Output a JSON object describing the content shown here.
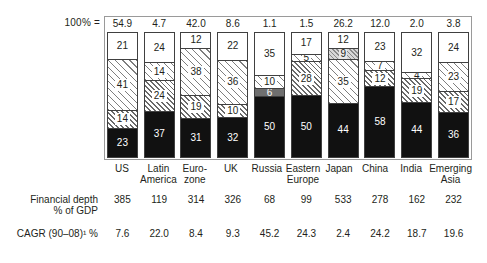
{
  "chart_data": {
    "type": "bar",
    "stacked": true,
    "title": "",
    "subtitle": "",
    "xlabel": "",
    "ylabel": "",
    "ylim": [
      0,
      100
    ],
    "grid": false,
    "legend_position": "none",
    "axis_note_label": "100% =",
    "categories": [
      "US",
      "Latin America",
      "Euro-zone",
      "UK",
      "Russia",
      "Eastern Europe",
      "Japan",
      "China",
      "India",
      "Emerging Asia"
    ],
    "category_lines": [
      [
        "US",
        ""
      ],
      [
        "Latin",
        "America"
      ],
      [
        "Euro-",
        "zone"
      ],
      [
        "UK",
        ""
      ],
      [
        "Russia",
        ""
      ],
      [
        "Eastern",
        "Europe"
      ],
      [
        "Japan",
        ""
      ],
      [
        "China",
        ""
      ],
      [
        "India",
        ""
      ],
      [
        "Emerging",
        "Asia"
      ]
    ],
    "totals": [
      "54.9",
      "4.7",
      "42.0",
      "8.6",
      "1.1",
      "1.5",
      "26.2",
      "12.0",
      "2.0",
      "3.8"
    ],
    "segments_top_to_bottom": [
      [
        {
          "value": 21,
          "fill": "white"
        },
        {
          "value": 41,
          "fill": "hatch"
        },
        {
          "value": 14,
          "fill": "hatch-dense"
        },
        {
          "value": 23,
          "fill": "black"
        }
      ],
      [
        {
          "value": 24,
          "fill": "white"
        },
        {
          "value": 14,
          "fill": "hatch"
        },
        {
          "value": 24,
          "fill": "hatch-dense"
        },
        {
          "value": 37,
          "fill": "black"
        }
      ],
      [
        {
          "value": 12,
          "fill": "white"
        },
        {
          "value": 38,
          "fill": "hatch"
        },
        {
          "value": 19,
          "fill": "hatch-dense"
        },
        {
          "value": 31,
          "fill": "black"
        }
      ],
      [
        {
          "value": 22,
          "fill": "white"
        },
        {
          "value": 36,
          "fill": "hatch"
        },
        {
          "value": 10,
          "fill": "hatch-dense"
        },
        {
          "value": 32,
          "fill": "black"
        }
      ],
      [
        {
          "value": 35,
          "fill": "white"
        },
        {
          "value": 10,
          "fill": "hatch"
        },
        {
          "value": 6,
          "fill": "gray"
        },
        {
          "value": 50,
          "fill": "black"
        }
      ],
      [
        {
          "value": 17,
          "fill": "white"
        },
        {
          "value": 5,
          "fill": "hatch"
        },
        {
          "value": 28,
          "fill": "hatch-dense"
        },
        {
          "value": 50,
          "fill": "black"
        }
      ],
      [
        {
          "value": 12,
          "fill": "white"
        },
        {
          "value": 9,
          "fill": "stipple"
        },
        {
          "value": 35,
          "fill": "hatch"
        },
        {
          "value": 44,
          "fill": "black"
        }
      ],
      [
        {
          "value": 23,
          "fill": "white"
        },
        {
          "value": 7,
          "fill": "hatch"
        },
        {
          "value": 12,
          "fill": "hatch-dense"
        },
        {
          "value": 58,
          "fill": "black"
        }
      ],
      [
        {
          "value": 32,
          "fill": "white"
        },
        {
          "value": 4,
          "fill": "hatch"
        },
        {
          "value": 19,
          "fill": "hatch-dense"
        },
        {
          "value": 44,
          "fill": "black"
        }
      ],
      [
        {
          "value": 24,
          "fill": "white"
        },
        {
          "value": 23,
          "fill": "hatch"
        },
        {
          "value": 17,
          "fill": "hatch-dense"
        },
        {
          "value": 36,
          "fill": "black"
        }
      ]
    ],
    "annotation_rows": [
      {
        "label_line1": "Financial depth",
        "label_line2": "% of GDP",
        "values": [
          "385",
          "119",
          "314",
          "326",
          "68",
          "99",
          "533",
          "278",
          "162",
          "232"
        ]
      },
      {
        "label_line1": "CAGR (90–08)¹ %",
        "label_line2": "",
        "values": [
          "7.6",
          "22.0",
          "8.4",
          "9.3",
          "45.2",
          "24.3",
          "2.4",
          "24.2",
          "18.7",
          "19.6"
        ]
      }
    ]
  },
  "colors": {
    "text": "#231f20",
    "frame": "#9a9a9a",
    "bar_border": "#404040",
    "fill_black": "#111111",
    "fill_gray": "#6f6f6f",
    "background": "#ffffff"
  }
}
